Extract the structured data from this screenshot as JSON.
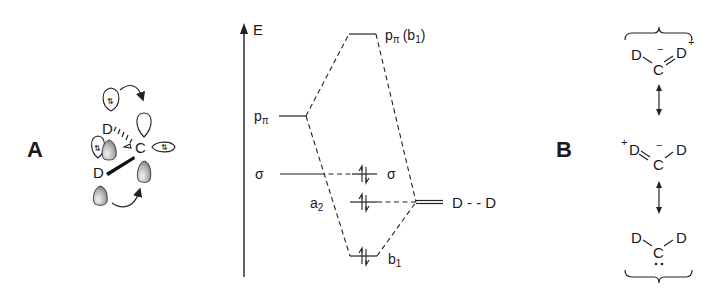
{
  "panelA": {
    "label": "A",
    "atoms": {
      "d_top": "D",
      "d_bottom": "D",
      "carbon": "C"
    },
    "electron_pair_symbol": "⇅"
  },
  "mo_diagram": {
    "energy_axis_label": "E",
    "levels": {
      "p_pi_left": {
        "main": "p",
        "sub": "π"
      },
      "sigma_left": "σ",
      "p_pi_b1": {
        "main": "p",
        "sub": "π",
        "sym": "(b",
        "sym_sub": "1",
        "close": ")"
      },
      "sigma_right": "σ",
      "a2": {
        "main": "a",
        "sub": "2"
      },
      "b1": {
        "main": "b",
        "sub": "1"
      },
      "dd": "D - - D"
    }
  },
  "panelB": {
    "label": "B",
    "structures": [
      {
        "left": "D",
        "center": "C",
        "right": "D",
        "charge_center": "−",
        "charge_right": "+"
      },
      {
        "left": "D",
        "center": "C",
        "right": "D",
        "charge_left": "+",
        "charge_center": "−"
      },
      {
        "left": "D",
        "center": "C",
        "right": "D",
        "lone_pair": "··"
      }
    ],
    "resonance_arrow": "↕"
  }
}
